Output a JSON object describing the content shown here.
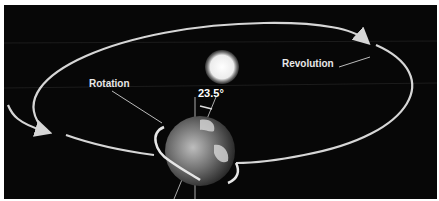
{
  "diagram": {
    "labels": {
      "rotation": "Rotation",
      "revolution": "Revolution",
      "axial_tilt": "23.5°"
    },
    "objects": [
      "sun",
      "earth",
      "orbit-path",
      "rotation-ring",
      "axis"
    ],
    "colors": {
      "background": "#070707",
      "orbit": "#d6d6d6",
      "label": "#e8e8e8",
      "sun": "#f4f4f4",
      "earth": "#8a8a8a"
    }
  }
}
